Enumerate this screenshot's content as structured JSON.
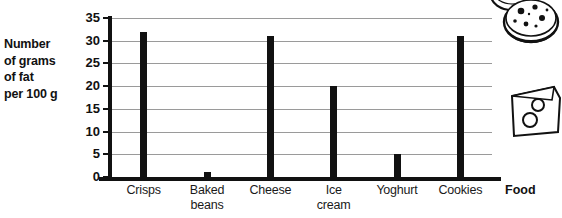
{
  "chart_data": {
    "type": "bar",
    "title": "",
    "subtitle": "",
    "ylabel": "Number of grams of fat per 100 g",
    "ylabel_lines": [
      "Number",
      "of grams",
      "of fat",
      "per 100 g"
    ],
    "xlabel": "Food",
    "categories": [
      "Crisps",
      "Baked beans",
      "Cheese",
      "Ice cream",
      "Yoghurt",
      "Cookies"
    ],
    "category_lines": [
      [
        "Crisps"
      ],
      [
        "Baked",
        "beans"
      ],
      [
        "Cheese"
      ],
      [
        "Ice",
        "cream"
      ],
      [
        "Yoghurt"
      ],
      [
        "Cookies"
      ]
    ],
    "values": [
      32,
      1,
      31,
      20,
      5,
      31
    ],
    "ylim": [
      0,
      35
    ],
    "ytick_step": 5,
    "yticks": [
      0,
      5,
      10,
      15,
      20,
      25,
      30,
      35
    ],
    "ytick_labels": [
      "0",
      "5",
      "10",
      "15",
      "20",
      "25",
      "30",
      "35"
    ],
    "grid": true,
    "grid_axis": "y",
    "legend": false,
    "legend_position": "none",
    "bar_color": "#111111",
    "grid_color": "#9a9a9a",
    "axis_color": "#111111"
  },
  "decorations": [
    {
      "name": "cookie-illustration",
      "label": "cookie"
    },
    {
      "name": "cookie-illustration-top",
      "label": "cookie"
    },
    {
      "name": "cheese-illustration",
      "label": "cheese-wedge"
    }
  ]
}
